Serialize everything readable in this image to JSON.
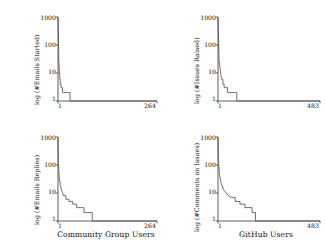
{
  "figure": {
    "background": "#ffffff",
    "line_color": "#555555",
    "axis_color": "#4a4a4a",
    "text_color": "#111111"
  },
  "chart_data": [
    {
      "id": "emails-started",
      "type": "line",
      "position": "top-left",
      "title": "",
      "ylabel": "log (#Emails Started)",
      "xlabel": "",
      "yscale": "log",
      "yticks": [
        1,
        10,
        100,
        1000
      ],
      "yticklabels": [
        "1",
        "10",
        "100",
        "1000"
      ],
      "ylim": [
        1,
        1000
      ],
      "xticks": [
        1,
        264
      ],
      "xticklabels": [
        "1",
        "264"
      ],
      "xlim": [
        1,
        264
      ],
      "grid": false,
      "legend": "none",
      "x": [
        1,
        2,
        3,
        4,
        5,
        6,
        7,
        9,
        11,
        13,
        16,
        20,
        26,
        33,
        264
      ],
      "values": [
        1000,
        300,
        30,
        18,
        10,
        6,
        4,
        3,
        3,
        2,
        2,
        2,
        2,
        1,
        1
      ]
    },
    {
      "id": "issues-raised",
      "type": "line",
      "position": "top-right",
      "title": "",
      "ylabel": "log (#Issues Raised)",
      "xlabel": "",
      "yscale": "log",
      "yticks": [
        1,
        10,
        100,
        1000
      ],
      "yticklabels": [
        "1",
        "10",
        "100",
        "1000"
      ],
      "ylim": [
        1,
        1000
      ],
      "xticks": [
        1,
        483
      ],
      "xticklabels": [
        "1",
        "483"
      ],
      "xlim": [
        1,
        483
      ],
      "grid": false,
      "legend": "none",
      "x": [
        1,
        3,
        6,
        10,
        14,
        18,
        24,
        30,
        38,
        46,
        55,
        66,
        78,
        90,
        483
      ],
      "values": [
        1000,
        260,
        30,
        16,
        9,
        6,
        4,
        3,
        3,
        2,
        2,
        2,
        2,
        1,
        1
      ]
    },
    {
      "id": "emails-replies",
      "type": "line",
      "position": "bottom-left",
      "title": "",
      "ylabel": "log (#Emails Replies)",
      "xlabel": "Community Group Users",
      "yscale": "log",
      "yticks": [
        1,
        10,
        100,
        1000
      ],
      "yticklabels": [
        "1",
        "10",
        "100",
        "1000"
      ],
      "ylim": [
        1,
        1000
      ],
      "xticks": [
        1,
        264
      ],
      "xticklabels": [
        "1",
        "264"
      ],
      "xlim": [
        1,
        264
      ],
      "grid": false,
      "legend": "none",
      "x": [
        1,
        2,
        4,
        7,
        11,
        16,
        22,
        30,
        40,
        50,
        60,
        70,
        80,
        92,
        264
      ],
      "values": [
        1000,
        130,
        40,
        20,
        12,
        8,
        6,
        5,
        4,
        3,
        3,
        2,
        2,
        1,
        1
      ]
    },
    {
      "id": "comments-on-issues",
      "type": "line",
      "position": "bottom-right",
      "title": "",
      "ylabel": "log (#Comments on Issues)",
      "xlabel": "GitHub Users",
      "yscale": "log",
      "yticks": [
        1,
        10,
        100,
        1000
      ],
      "yticklabels": [
        "1",
        "10",
        "100",
        "1000"
      ],
      "ylim": [
        1,
        1000
      ],
      "xticks": [
        1,
        483
      ],
      "xticklabels": [
        "1",
        "483"
      ],
      "xlim": [
        1,
        483
      ],
      "grid": false,
      "legend": "none",
      "x": [
        1,
        3,
        8,
        16,
        28,
        44,
        62,
        82,
        105,
        128,
        148,
        162,
        172,
        178,
        483
      ],
      "values": [
        1000,
        150,
        45,
        22,
        13,
        9,
        7,
        5,
        4,
        3,
        3,
        2,
        2,
        1,
        1
      ]
    }
  ]
}
